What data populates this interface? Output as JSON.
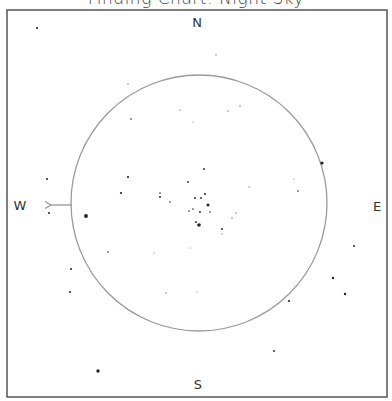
{
  "title": {
    "text": "Finding Chart: Night Sky",
    "note": "clipped at top edge; only descenders visible"
  },
  "frame": {
    "x": 7,
    "y": 10,
    "width": 380,
    "height": 387,
    "stroke": "#555555"
  },
  "field_circle": {
    "cx": 199,
    "cy": 203,
    "r": 128,
    "stroke": "#9a9a9a"
  },
  "compass": {
    "north": "N",
    "south": "S",
    "east": "E",
    "west": "W",
    "positions": {
      "north": {
        "x": 197,
        "y": 27
      },
      "south": {
        "x": 198,
        "y": 389
      },
      "east": {
        "x": 377,
        "y": 211
      },
      "west": {
        "x": 20,
        "y": 210
      }
    },
    "color": "#333333"
  },
  "direction_arrow": {
    "x1": 72,
    "y1": 205,
    "x2": 51,
    "y2": 205,
    "color": "#999999",
    "label": "motion-west-arrow"
  },
  "stars": [
    {
      "x": 37,
      "y": 28,
      "r": 1.1
    },
    {
      "x": 216,
      "y": 55,
      "r": 0.7
    },
    {
      "x": 128,
      "y": 84,
      "r": 0.7
    },
    {
      "x": 180,
      "y": 110,
      "r": 0.7
    },
    {
      "x": 228,
      "y": 111,
      "r": 0.7
    },
    {
      "x": 240,
      "y": 106,
      "r": 0.7
    },
    {
      "x": 131,
      "y": 119,
      "r": 0.8
    },
    {
      "x": 193,
      "y": 122,
      "r": 0.6
    },
    {
      "x": 322,
      "y": 163,
      "r": 1.6
    },
    {
      "x": 204,
      "y": 169,
      "r": 0.9
    },
    {
      "x": 128,
      "y": 177,
      "r": 1.1
    },
    {
      "x": 47,
      "y": 179,
      "r": 1.0
    },
    {
      "x": 294,
      "y": 179,
      "r": 0.6
    },
    {
      "x": 188,
      "y": 182,
      "r": 0.9
    },
    {
      "x": 249,
      "y": 187,
      "r": 0.7
    },
    {
      "x": 298,
      "y": 191,
      "r": 0.8
    },
    {
      "x": 121,
      "y": 193,
      "r": 1.1
    },
    {
      "x": 160,
      "y": 193,
      "r": 0.8
    },
    {
      "x": 160,
      "y": 197,
      "r": 1.0
    },
    {
      "x": 205,
      "y": 194,
      "r": 1.0
    },
    {
      "x": 195,
      "y": 198,
      "r": 0.9
    },
    {
      "x": 201,
      "y": 198,
      "r": 0.9
    },
    {
      "x": 170,
      "y": 202,
      "r": 0.8
    },
    {
      "x": 208,
      "y": 205,
      "r": 1.5
    },
    {
      "x": 193,
      "y": 209,
      "r": 0.8
    },
    {
      "x": 189,
      "y": 211,
      "r": 0.8
    },
    {
      "x": 200,
      "y": 212,
      "r": 0.9
    },
    {
      "x": 210,
      "y": 212,
      "r": 0.8
    },
    {
      "x": 49,
      "y": 213,
      "r": 1.0
    },
    {
      "x": 236,
      "y": 213,
      "r": 0.7
    },
    {
      "x": 86,
      "y": 216,
      "r": 1.9
    },
    {
      "x": 232,
      "y": 218,
      "r": 0.7
    },
    {
      "x": 196,
      "y": 222,
      "r": 0.9
    },
    {
      "x": 199,
      "y": 225,
      "r": 1.8
    },
    {
      "x": 222,
      "y": 229,
      "r": 0.9
    },
    {
      "x": 222,
      "y": 234,
      "r": 0.7
    },
    {
      "x": 354,
      "y": 246,
      "r": 1.0
    },
    {
      "x": 190,
      "y": 248,
      "r": 0.6
    },
    {
      "x": 108,
      "y": 252,
      "r": 0.8
    },
    {
      "x": 154,
      "y": 253,
      "r": 0.6
    },
    {
      "x": 71,
      "y": 269,
      "r": 1.0
    },
    {
      "x": 333,
      "y": 278,
      "r": 1.2
    },
    {
      "x": 70,
      "y": 292,
      "r": 1.0
    },
    {
      "x": 166,
      "y": 293,
      "r": 0.7
    },
    {
      "x": 197,
      "y": 292,
      "r": 0.6
    },
    {
      "x": 345,
      "y": 294,
      "r": 1.2
    },
    {
      "x": 289,
      "y": 301,
      "r": 1.1
    },
    {
      "x": 274,
      "y": 351,
      "r": 0.9
    },
    {
      "x": 98,
      "y": 371,
      "r": 1.7
    }
  ]
}
